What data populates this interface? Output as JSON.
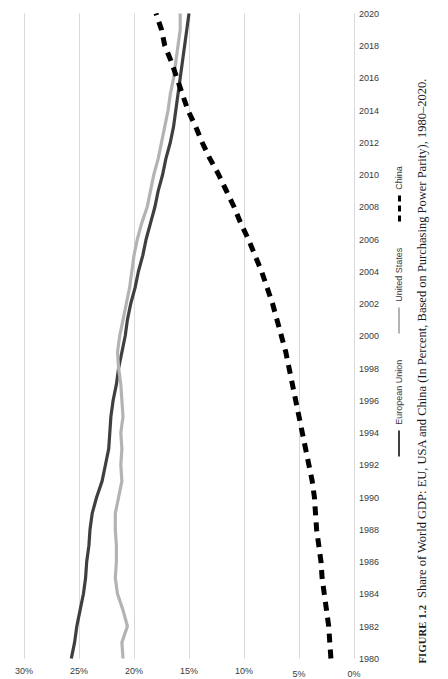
{
  "figure": {
    "caption_label": "FIGURE 1.2",
    "caption_text": "Share of World GDP: EU, USA and China (In Percent, Based on Purchasing Power Parity), 1980–2020."
  },
  "colors": {
    "european_union": "#3f3f3f",
    "united_states": "#b3b3b3",
    "china": "#000000",
    "gridline": "#d9d9d9",
    "tick_text": "#3a3a3a"
  },
  "legend": {
    "position": "bottom",
    "items": [
      {
        "label": "European Union",
        "color": "#3f3f3f",
        "style": "solid"
      },
      {
        "label": "United States",
        "color": "#b3b3b3",
        "style": "solid"
      },
      {
        "label": "China",
        "color": "#000000",
        "style": "dashed"
      }
    ]
  },
  "chart_data": {
    "type": "line",
    "title": "",
    "xlabel": "",
    "ylabel": "",
    "grid": true,
    "legend_position": "bottom",
    "xlim": [
      1980,
      2020
    ],
    "ylim": [
      0,
      30
    ],
    "ytick_labels": [
      "0%",
      "5%",
      "10%",
      "15%",
      "20%",
      "25%",
      "30%"
    ],
    "ytick_values": [
      0,
      5,
      10,
      15,
      20,
      25,
      30
    ],
    "xtick_labels": [
      "1980",
      "1982",
      "1984",
      "1986",
      "1988",
      "1990",
      "1992",
      "1994",
      "1996",
      "1998",
      "2000",
      "2002",
      "2004",
      "2006",
      "2008",
      "2010",
      "2012",
      "2014",
      "2016",
      "2018",
      "2020"
    ],
    "x": [
      1980,
      1981,
      1982,
      1983,
      1984,
      1985,
      1986,
      1987,
      1988,
      1989,
      1990,
      1991,
      1992,
      1993,
      1994,
      1995,
      1996,
      1997,
      1998,
      1999,
      2000,
      2001,
      2002,
      2003,
      2004,
      2005,
      2006,
      2007,
      2008,
      2009,
      2010,
      2011,
      2012,
      2013,
      2014,
      2015,
      2016,
      2017,
      2018,
      2019,
      2020
    ],
    "series": [
      {
        "name": "European Union",
        "color": "#3f3f3f",
        "style": "solid",
        "values": [
          25.7,
          25.4,
          25.2,
          24.9,
          24.6,
          24.4,
          24.3,
          24.1,
          24.0,
          23.8,
          23.4,
          22.9,
          22.6,
          22.3,
          22.2,
          22.1,
          21.9,
          21.6,
          21.4,
          21.1,
          20.8,
          20.6,
          20.3,
          19.9,
          19.6,
          19.2,
          18.9,
          18.5,
          18.1,
          17.8,
          17.4,
          17.1,
          16.7,
          16.4,
          16.2,
          16.0,
          15.8,
          15.6,
          15.4,
          15.2,
          15.0
        ]
      },
      {
        "name": "United States",
        "color": "#b3b3b3",
        "style": "solid",
        "values": [
          21.0,
          21.1,
          20.6,
          21.0,
          21.5,
          21.7,
          21.6,
          21.6,
          21.7,
          21.7,
          21.4,
          21.1,
          21.2,
          21.1,
          21.2,
          21.0,
          21.1,
          21.2,
          21.4,
          21.5,
          21.3,
          21.0,
          20.7,
          20.4,
          20.2,
          20.0,
          19.7,
          19.3,
          18.8,
          18.5,
          18.2,
          17.8,
          17.5,
          17.2,
          16.9,
          16.7,
          16.4,
          16.2,
          16.0,
          15.8,
          15.8
        ]
      },
      {
        "name": "China",
        "color": "#000000",
        "style": "dashed",
        "values": [
          2.1,
          2.2,
          2.3,
          2.5,
          2.7,
          2.9,
          3.0,
          3.2,
          3.4,
          3.5,
          3.6,
          3.8,
          4.1,
          4.4,
          4.7,
          5.0,
          5.3,
          5.6,
          5.9,
          6.2,
          6.6,
          7.0,
          7.4,
          7.9,
          8.4,
          9.0,
          9.6,
          10.3,
          10.9,
          11.6,
          12.3,
          13.1,
          13.8,
          14.4,
          15.1,
          15.6,
          16.1,
          16.6,
          17.2,
          17.5,
          18.0
        ]
      }
    ]
  }
}
